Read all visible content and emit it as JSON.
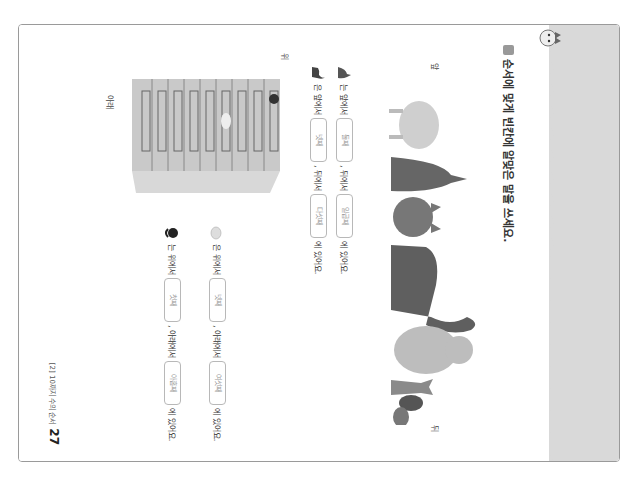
{
  "page": {
    "instruction": "순서에 맞게 빈칸에 알맞은 말을 쓰세요.",
    "labels": {
      "front": "앞",
      "back": "뒤",
      "top": "위",
      "bottom": "아래"
    },
    "row_sentences": [
      {
        "subject_icon": "kangaroo-icon",
        "particle": "는",
        "front_phrase": "앞에서",
        "front_answer": "둘째",
        "back_phrase": ", 뒤에서",
        "back_answer": "일곱째",
        "ending": "에 있어요."
      },
      {
        "subject_icon": "dinosaur-icon",
        "particle": "은",
        "front_phrase": "앞에서",
        "front_answer": "넷째",
        "back_phrase": ", 뒤에서",
        "back_answer": "다섯째",
        "ending": "에 있어요."
      }
    ],
    "column_sentences": [
      {
        "subject_icon": "sheep-icon",
        "particle": "은",
        "top_phrase": "위에서",
        "top_answer": "넷째",
        "bottom_phrase": ", 아래에서",
        "bottom_answer": "여섯째",
        "ending": "에 있어요."
      },
      {
        "subject_icon": "monkey-icon",
        "particle": "는",
        "top_phrase": "위에서",
        "top_answer": "첫째",
        "bottom_phrase": ", 아래에서",
        "bottom_answer": "아홉째",
        "ending": "에 있어요."
      }
    ],
    "animals_in_row": [
      "sheep",
      "kangaroo",
      "cat",
      "dinosaur",
      "bear",
      "fox",
      "raccoon",
      "turtle"
    ],
    "footer": {
      "unit": "[2] 10까지 수의 순서",
      "page_number": "27"
    }
  },
  "colors": {
    "band": "#d9d9d9",
    "border": "#9a9a9a",
    "answer_text": "#999999",
    "text": "#333333"
  }
}
